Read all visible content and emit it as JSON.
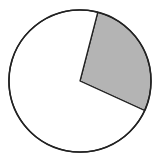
{
  "chart_data": {
    "type": "pie",
    "title": "",
    "categories": [
      "Shaded",
      "Unshaded"
    ],
    "values": [
      27.8,
      72.2
    ],
    "start_angle_deg": 14.5,
    "direction": "clockwise",
    "colors": [
      "#b4b4b4",
      "#ffffff"
    ],
    "stroke": "#222222",
    "legend": "none",
    "labels": "none"
  },
  "layout": {
    "cx": 80,
    "cy": 81,
    "r": 71
  }
}
